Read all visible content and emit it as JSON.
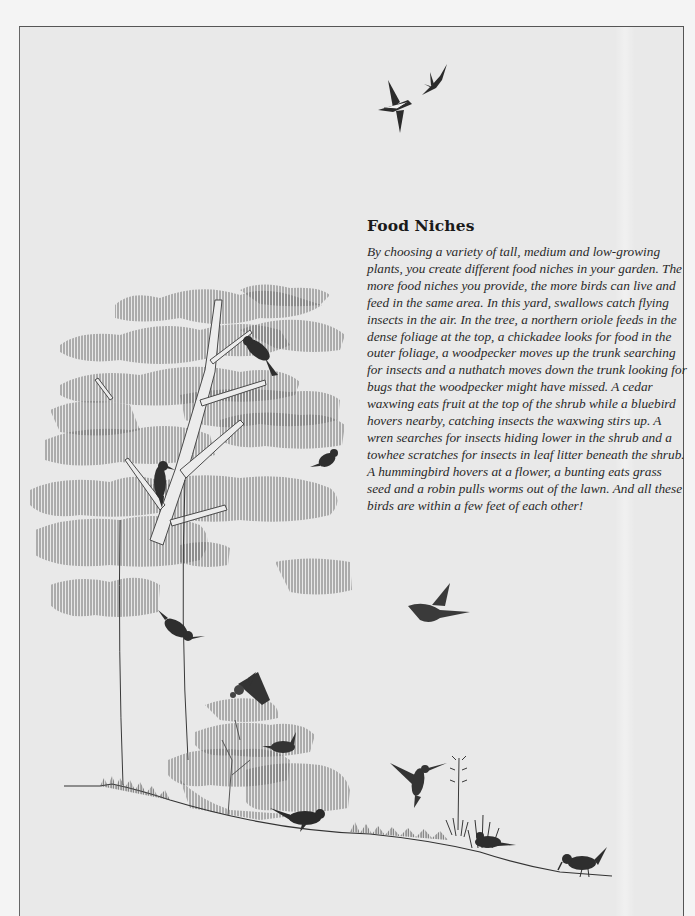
{
  "article": {
    "title": "Food Niches",
    "body": "By choosing a variety of tall, medium and low-growing plants, you create different food niches in your garden. The more food niches you provide, the more birds can live and feed in the same area. In this yard, swallows catch flying insects in the air. In the tree, a northern oriole feeds in the dense foliage at the top, a chickadee looks for food in the outer foliage, a woodpecker moves up the trunk searching for insects and a nuthatch moves down the trunk looking for bugs that the woodpecker might have missed. A cedar waxwing eats fruit at the top of the shrub while a bluebird hovers nearby, catching insects the waxwing stirs up. A wren searches for insects hiding lower in the shrub and a towhee scratches for insects in leaf litter beneath the shrub. A hummingbird hovers at a flower, a bunting eats grass seed and a robin pulls worms out of the lawn. And all these birds are within a few feet of each other!"
  },
  "illustration": {
    "subject": "backyard food niches",
    "elements": [
      "swallows",
      "tree",
      "northern-oriole",
      "chickadee",
      "woodpecker",
      "nuthatch",
      "bluebird",
      "cedar-waxwing",
      "shrub",
      "wren",
      "towhee",
      "hummingbird",
      "flower",
      "bunting",
      "robin",
      "lawn"
    ],
    "colors": {
      "ink": "#2b2b2b",
      "foliage": "#7a7a7a",
      "paper": "#e9e9e9"
    }
  }
}
